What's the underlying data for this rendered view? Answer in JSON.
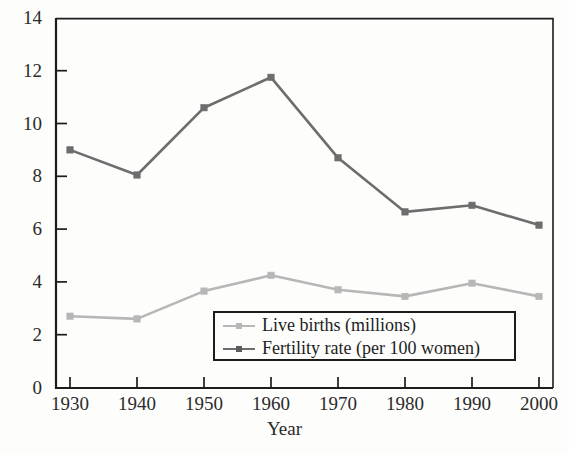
{
  "chart_data": {
    "type": "line",
    "title": "",
    "xlabel": "Year",
    "ylabel": "",
    "x": [
      1930,
      1940,
      1950,
      1960,
      1970,
      1980,
      1990,
      2000
    ],
    "categories": [
      "1930",
      "1940",
      "1950",
      "1960",
      "1970",
      "1980",
      "1990",
      "2000"
    ],
    "series": [
      {
        "name": "Live births (millions)",
        "color": "#b7b7b7",
        "values": [
          2.7,
          2.6,
          3.65,
          4.25,
          3.7,
          3.45,
          3.95,
          3.45
        ]
      },
      {
        "name": "Fertility rate (per 100 women)",
        "color": "#6d6d6d",
        "values": [
          9.0,
          8.05,
          10.6,
          11.75,
          8.7,
          6.65,
          6.9,
          6.15
        ]
      }
    ],
    "xlim": [
      1925,
      2005
    ],
    "ylim": [
      0,
      14
    ],
    "yticks": [
      0,
      2,
      4,
      6,
      8,
      10,
      12,
      14
    ],
    "ytick_labels": [
      "0",
      "2",
      "4",
      "6",
      "8",
      "10",
      "12",
      "14"
    ],
    "xticks": [
      1930,
      1940,
      1950,
      1960,
      1970,
      1980,
      1990,
      2000
    ],
    "xtick_labels": [
      "1930",
      "1940",
      "1950",
      "1960",
      "1970",
      "1980",
      "1990",
      "2000"
    ],
    "grid": false,
    "legend_position": "lower center",
    "frame_color": "#1c1c1c",
    "background_color": "#fdfdfc"
  },
  "axis": {
    "x_title": "Year"
  },
  "legend": {
    "items": [
      {
        "label": "Live births (millions)",
        "color": "#b7b7b7"
      },
      {
        "label": "Fertility rate (per 100 women)",
        "color": "#6d6d6d"
      }
    ]
  }
}
